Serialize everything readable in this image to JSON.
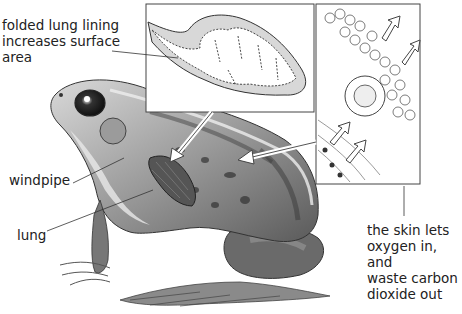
{
  "labels": {
    "folded_lining": "folded lung lining\nincreases surface\narea",
    "windpipe": "windpipe",
    "lung": "lung",
    "skin": "the skin lets\noxygen in, and\nwaste carbon\ndioxide out"
  },
  "insets": {
    "lung_section": "lung cross-section inset",
    "skin_section": "skin cell inset"
  }
}
